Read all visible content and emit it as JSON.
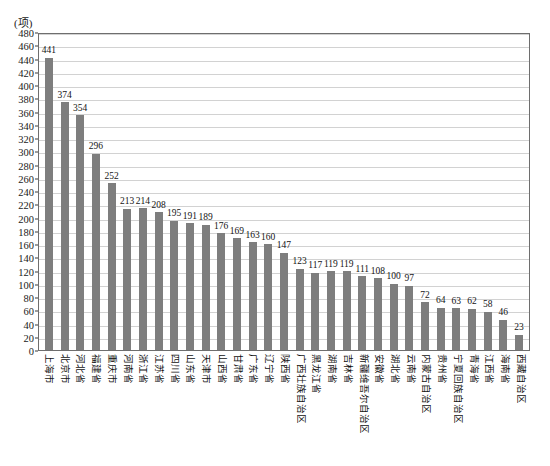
{
  "chart_data": {
    "type": "bar",
    "title": "",
    "subtitle": "",
    "unit_label": "(项)",
    "xlabel": "",
    "ylabel": "",
    "ylim": [
      0,
      480
    ],
    "ytick_step": 20,
    "yticks": [
      0,
      20,
      40,
      60,
      80,
      100,
      120,
      140,
      160,
      180,
      200,
      220,
      240,
      260,
      280,
      300,
      320,
      340,
      360,
      380,
      400,
      420,
      440,
      460,
      480
    ],
    "grid": true,
    "legend": "none",
    "bar_color": "#7e7e7e",
    "categories": [
      "上海市",
      "北京市",
      "河北省",
      "福建省",
      "重庆市",
      "河南省",
      "浙江省",
      "江苏省",
      "四川省",
      "山东省",
      "天津市",
      "山西省",
      "甘肃省",
      "广东省",
      "辽宁省",
      "陕西省",
      "广西壮族自治区",
      "黑龙江省",
      "湖南省",
      "吉林省",
      "新疆维吾尔自治区",
      "安徽省",
      "湖北省",
      "云南省",
      "内蒙古自治区",
      "贵州省",
      "宁夏回族自治区",
      "青海省",
      "江西省",
      "海南省",
      "西藏自治区"
    ],
    "values": [
      441,
      374,
      354,
      296,
      252,
      213,
      214,
      208,
      195,
      191,
      189,
      176,
      169,
      163,
      160,
      147,
      123,
      117,
      119,
      119,
      111,
      108,
      100,
      97,
      72,
      64,
      63,
      62,
      58,
      46,
      23
    ]
  }
}
